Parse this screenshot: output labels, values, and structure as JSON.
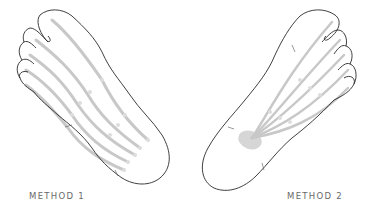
{
  "figure": {
    "panels": [
      {
        "id": "method-1",
        "label": "METHOD 1",
        "foot": "left",
        "strokes": 5,
        "pattern": "parallel lines from toes to heel"
      },
      {
        "id": "method-2",
        "label": "METHOD 2",
        "foot": "right",
        "strokes": 5,
        "pattern": "lines converging from toes to a point on the sole"
      }
    ],
    "colors": {
      "outline": "#2a2a2a",
      "stroke_lines": "#c8c8c8",
      "focus_point": "#d6d6d6",
      "label_text": "#6a6a6a",
      "background": "#ffffff"
    }
  }
}
